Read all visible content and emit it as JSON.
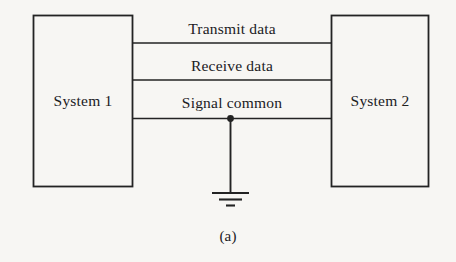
{
  "figure": {
    "caption": "(a)",
    "stroke_color": "#232323",
    "background_color": "#f7f6f3"
  },
  "blocks": [
    {
      "id": "system-1",
      "label": "System 1"
    },
    {
      "id": "system-2",
      "label": "System 2"
    }
  ],
  "connections": [
    {
      "id": "transmit-data",
      "label": "Transmit data"
    },
    {
      "id": "receive-data",
      "label": "Receive data"
    },
    {
      "id": "signal-common",
      "label": "Signal common"
    }
  ],
  "ground": {
    "id": "earth-ground-symbol",
    "junction": "signal-common-junction-dot"
  }
}
